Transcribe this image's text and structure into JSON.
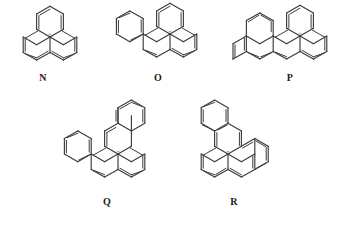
{
  "figure": {
    "kind": "chemical-structure-panel",
    "background_color": "#ffffff",
    "line_color": "#3b3b3b",
    "label_color": "#1a1a1a",
    "charge_glyph": "+",
    "charge_color": "#8a8a8a"
  },
  "structures": [
    {
      "id": "N",
      "label": "N",
      "name": "phenalenyl cation",
      "ring_count": 3,
      "charge": "+",
      "row": 1,
      "column": 1,
      "label_x": 43,
      "label_y": 76
    },
    {
      "id": "O",
      "label": "O",
      "name": "benzo[a]phenalenyl cation",
      "ring_count": 4,
      "charge": "+",
      "row": 1,
      "column": 2,
      "label_x": 158,
      "label_y": 76
    },
    {
      "id": "P",
      "label": "P",
      "name": "dibenzo phenalenyl cation",
      "ring_count": 5,
      "charge": "+",
      "row": 1,
      "column": 3,
      "label_x": 290,
      "label_y": 76
    },
    {
      "id": "Q",
      "label": "Q",
      "name": "dibenzo phenalenyl cation isomer",
      "ring_count": 5,
      "charge": "+",
      "row": 2,
      "column": 1,
      "label_x": 107,
      "label_y": 200
    },
    {
      "id": "R",
      "label": "R",
      "name": "dibenzo phenalenyl cation isomer",
      "ring_count": 5,
      "charge": "+",
      "row": 2,
      "column": 2,
      "label_x": 234,
      "label_y": 200
    }
  ]
}
